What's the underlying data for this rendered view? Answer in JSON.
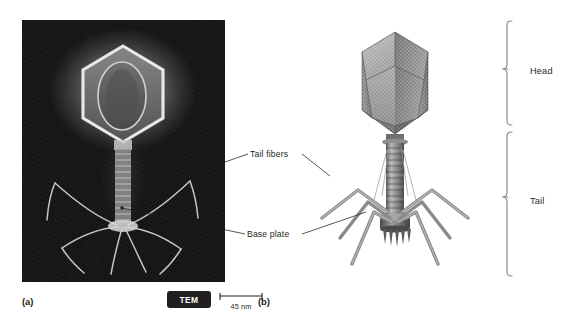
{
  "figure": {
    "type": "scientific-figure",
    "background_color": "#ffffff",
    "text_color": "#231f20"
  },
  "panels": [
    {
      "id": "a",
      "label": "(a)",
      "kind": "micrograph",
      "imaging_technique_badge": "TEM",
      "badge_background": "#231f20",
      "badge_text_color": "#ffffff",
      "background_color": "#0e0e0e",
      "scale_bar": {
        "caption": "45 nm",
        "length_value": 45,
        "length_unit": "nm"
      }
    },
    {
      "id": "b",
      "label": "(b)",
      "kind": "illustration",
      "background_color": "#ffffff"
    }
  ],
  "callouts": [
    {
      "id": "tail-fibers",
      "label": "Tail fibers",
      "points_to": [
        "panel-a",
        "panel-b"
      ]
    },
    {
      "id": "base-plate",
      "label": "Base plate",
      "points_to": [
        "panel-a",
        "panel-b"
      ]
    }
  ],
  "braces": [
    {
      "id": "head",
      "label": "Head",
      "region": "capsid"
    },
    {
      "id": "tail",
      "label": "Tail",
      "region": "sheath-baseplate-fibers"
    }
  ]
}
